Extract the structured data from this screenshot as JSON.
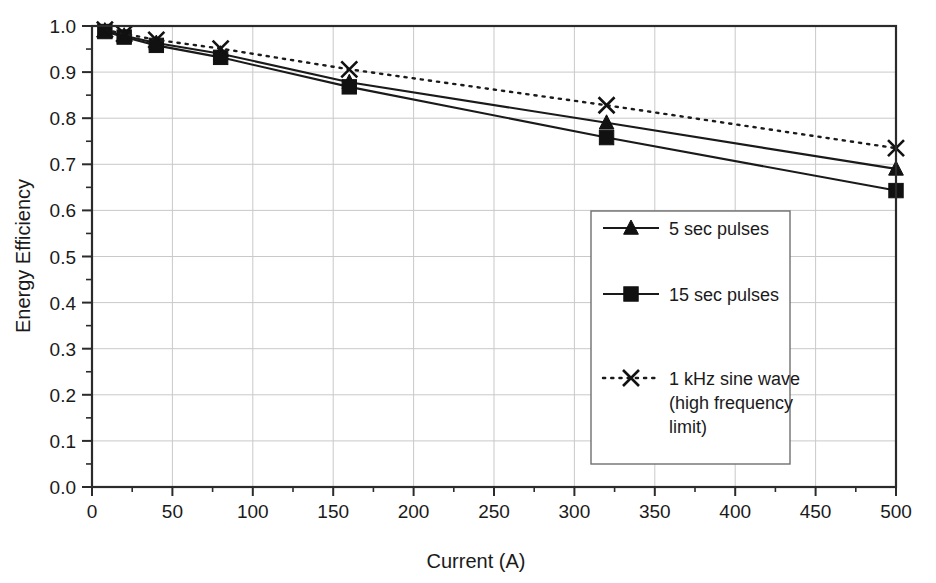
{
  "chart_data": {
    "type": "line",
    "title": "",
    "xlabel": "Current (A)",
    "ylabel": "Energy Efficiency",
    "xlim": [
      0,
      500
    ],
    "ylim": [
      0.0,
      1.0
    ],
    "xticks": [
      0,
      50,
      100,
      150,
      200,
      250,
      300,
      350,
      400,
      450,
      500
    ],
    "xtick_labels": [
      "0",
      "50",
      "100",
      "150",
      "200",
      "250",
      "300",
      "350",
      "400",
      "450",
      "500"
    ],
    "yticks": [
      0.0,
      0.1,
      0.2,
      0.3,
      0.4,
      0.5,
      0.6,
      0.7,
      0.8,
      0.9,
      1.0
    ],
    "ytick_labels": [
      "0.0",
      "0.1",
      "0.2",
      "0.3",
      "0.4",
      "0.5",
      "0.6",
      "0.7",
      "0.8",
      "0.9",
      "1.0"
    ],
    "x_minor_tick_step": 25,
    "y_minor_tick_step": 0.05,
    "grid": true,
    "grid_axes": "both",
    "legend_position": "center-right-inside",
    "x": [
      8,
      20,
      40,
      80,
      160,
      320,
      500
    ],
    "series": [
      {
        "name": "5 sec pulses",
        "marker": "triangle",
        "line_style": "solid",
        "color": "#111111",
        "values": [
          0.99,
          0.979,
          0.963,
          0.94,
          0.878,
          0.79,
          0.69
        ]
      },
      {
        "name": "15 sec pulses",
        "marker": "square",
        "line_style": "solid",
        "color": "#111111",
        "values": [
          0.988,
          0.976,
          0.958,
          0.932,
          0.868,
          0.758,
          0.643
        ]
      },
      {
        "name": "1 kHz sine wave (high frequency limit)",
        "marker": "cross",
        "line_style": "dotted",
        "color": "#111111",
        "values": [
          0.992,
          0.983,
          0.97,
          0.951,
          0.906,
          0.828,
          0.735
        ]
      }
    ]
  },
  "axes": {
    "x_title": "Current (A)",
    "y_title": "Energy Efficiency"
  },
  "legend": {
    "entries": [
      {
        "label": "5 sec pulses",
        "marker": "triangle",
        "style": "solid"
      },
      {
        "label": "15 sec pulses",
        "marker": "square",
        "style": "solid"
      },
      {
        "label": "1 kHz sine wave",
        "marker": "cross",
        "style": "dotted"
      },
      {
        "label": "(high frequency",
        "marker": "none",
        "style": "none"
      },
      {
        "label": "limit)",
        "marker": "none",
        "style": "none"
      }
    ]
  }
}
